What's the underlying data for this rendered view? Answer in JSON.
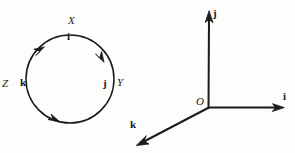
{
  "figure": {
    "background_color": "#fdfdfb",
    "ink_color": "#1a1a1a",
    "width": 295,
    "height": 153,
    "cycle_diagram": {
      "name": "cyclic-permutation-circle",
      "direction": "clockwise",
      "center_x": 70,
      "center_y": 79,
      "radius": 44,
      "arrowhead_angles_deg": [
        45,
        135,
        250
      ],
      "labels": {
        "top_outer": "X",
        "top_inner": "i",
        "left_outer": "Z",
        "left_inner": "k",
        "right_inner": "j",
        "right_outer": "Y"
      }
    },
    "axis_frame": {
      "name": "right-handed-coordinate-frame",
      "origin_label": "O",
      "origin_x": 208,
      "origin_y": 108,
      "axes": [
        {
          "label": "j",
          "tip_x": 209,
          "tip_y": 12,
          "direction": "up"
        },
        {
          "label": "i",
          "tip_x": 284,
          "tip_y": 107,
          "direction": "right"
        },
        {
          "label": "k",
          "tip_x": 137,
          "tip_y": 146,
          "direction": "down-left"
        }
      ]
    }
  }
}
